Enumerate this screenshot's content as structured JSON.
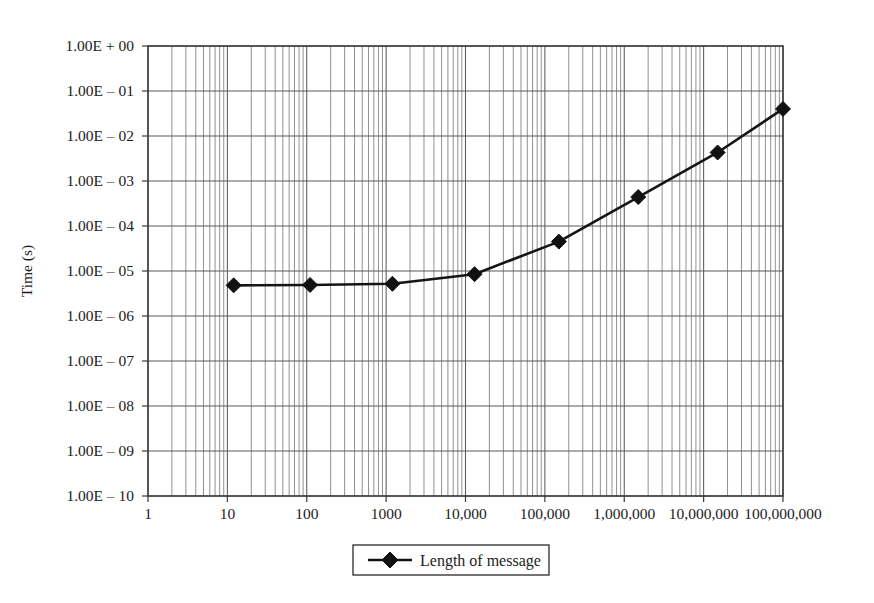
{
  "chart_data": {
    "type": "line",
    "title": "",
    "subtitle": "",
    "xlabel": "",
    "ylabel": "Time (s)",
    "xscale": "log",
    "yscale": "log",
    "xlim": [
      1,
      100000000
    ],
    "ylim": [
      1e-10,
      1
    ],
    "grid": true,
    "grid_minor": true,
    "legend_position": "bottom-center",
    "legend": [
      "Length of message"
    ],
    "x_tick_labels": [
      "1",
      "10",
      "100",
      "1000",
      "10,000",
      "100,000",
      "1,000,000",
      "10,000,000",
      "100,000,000"
    ],
    "x_tick_values": [
      1,
      10,
      100,
      1000,
      10000,
      100000,
      1000000,
      10000000,
      100000000
    ],
    "y_tick_labels": [
      "1.00E + 00",
      "1.00E – 01",
      "1.00E – 02",
      "1.00E – 03",
      "1.00E – 04",
      "1.00E – 05",
      "1.00E – 06",
      "1.00E – 07",
      "1.00E – 08",
      "1.00E – 09",
      "1.00E – 10"
    ],
    "y_tick_values": [
      1,
      0.1,
      0.01,
      0.001,
      0.0001,
      1e-05,
      1e-06,
      1e-07,
      1e-08,
      1e-09,
      1e-10
    ],
    "series": [
      {
        "name": "Length of message",
        "marker": "diamond",
        "color": "#111111",
        "x": [
          12,
          110,
          1200,
          13000,
          150000,
          1500000,
          15000000,
          100000000
        ],
        "y": [
          4.8e-06,
          4.9e-06,
          5.2e-06,
          8.5e-06,
          4.5e-05,
          0.00044,
          0.0043,
          0.04
        ]
      }
    ]
  },
  "axes": {
    "y_axis_title": "Time (s)"
  },
  "legend": {
    "entries": [
      {
        "label": "Length of message",
        "marker": "diamond",
        "color": "#111111"
      }
    ]
  }
}
